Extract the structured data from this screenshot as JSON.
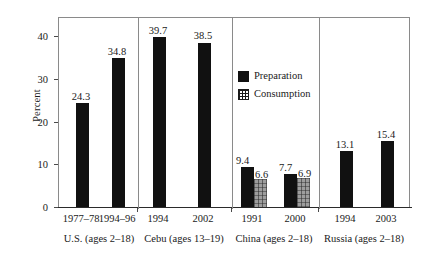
{
  "chart_data": {
    "type": "bar",
    "title": "",
    "subtitle": "",
    "xlabel": "",
    "ylabel": "Percent",
    "ylim": [
      0,
      44.7
    ],
    "yticks": [
      0,
      10,
      20,
      30,
      40
    ],
    "ytick_labels": [
      "0",
      "10",
      "20",
      "30",
      "40"
    ],
    "grid": false,
    "legend_position": "inside-center-upper",
    "series": [
      {
        "name": "Preparation",
        "color": "#111111",
        "pattern": "solid"
      },
      {
        "name": "Consumption",
        "color": "#9d9d9d",
        "pattern": "grid"
      }
    ],
    "panels": [
      {
        "group_label": "U.S. (ages 2–18)",
        "categories": [
          "1977–78",
          "1994–96"
        ],
        "bars": [
          {
            "category": "1977–78",
            "series": "Preparation",
            "value": 24.3,
            "label": "24.3"
          },
          {
            "category": "1994–96",
            "series": "Preparation",
            "value": 34.8,
            "label": "34.8"
          }
        ]
      },
      {
        "group_label": "Cebu (ages 13–19)",
        "categories": [
          "1994",
          "2002"
        ],
        "bars": [
          {
            "category": "1994",
            "series": "Preparation",
            "value": 39.7,
            "label": "39.7"
          },
          {
            "category": "2002",
            "series": "Preparation",
            "value": 38.5,
            "label": "38.5"
          }
        ]
      },
      {
        "group_label": "China (ages 2–18)",
        "categories": [
          "1991",
          "2000"
        ],
        "bars": [
          {
            "category": "1991",
            "series": "Preparation",
            "value": 9.4,
            "label": "9.4"
          },
          {
            "category": "1991",
            "series": "Consumption",
            "value": 6.6,
            "label": "6.6"
          },
          {
            "category": "2000",
            "series": "Preparation",
            "value": 7.7,
            "label": "7.7"
          },
          {
            "category": "2000",
            "series": "Consumption",
            "value": 6.9,
            "label": "6.9"
          }
        ]
      },
      {
        "group_label": "Russia (ages 2–18)",
        "categories": [
          "1994",
          "2003"
        ],
        "bars": [
          {
            "category": "1994",
            "series": "Preparation",
            "value": 13.1,
            "label": "13.1"
          },
          {
            "category": "2003",
            "series": "Preparation",
            "value": 15.4,
            "label": "15.4"
          }
        ]
      }
    ]
  },
  "axis": {
    "y_title": "Percent",
    "ticks": [
      {
        "label": "40",
        "top": 32
      },
      {
        "label": "30",
        "top": 74.8
      },
      {
        "label": "20",
        "top": 117.5
      },
      {
        "label": "10",
        "top": 160.2
      },
      {
        "label": "0",
        "top": 202.9
      }
    ]
  },
  "legend": {
    "items": [
      {
        "label": "Preparation",
        "swatch": "solid-black"
      },
      {
        "label": "Consumption",
        "swatch": "grid-hatch"
      }
    ]
  },
  "xaxis": {
    "ticks": [
      {
        "label": "1977–78",
        "center": 81
      },
      {
        "label": "1994–96",
        "center": 117
      },
      {
        "label": "1994",
        "center": 158
      },
      {
        "label": "2002",
        "center": 203
      },
      {
        "label": "1991",
        "center": 252
      },
      {
        "label": "2000",
        "center": 295
      },
      {
        "label": "1994",
        "center": 345
      },
      {
        "label": "2003",
        "center": 386
      }
    ],
    "groups": [
      {
        "label": "U.S. (ages 2–18)",
        "center": 99
      },
      {
        "label": "Cebu (ages 13–19)",
        "center": 184
      },
      {
        "label": "China (ages 2–18)",
        "center": 274
      },
      {
        "label": "Russia (ages 2–18)",
        "center": 364
      }
    ]
  }
}
